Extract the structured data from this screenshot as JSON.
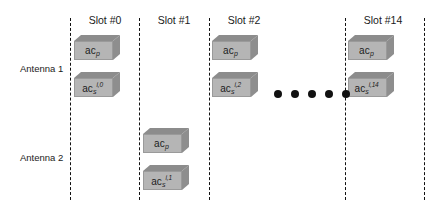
{
  "figure": {
    "background_color": "#ffffff",
    "line_color": "#111111",
    "box_face_color": "#b5b5b5",
    "box_shade_color": "#8c8c8c"
  },
  "rows": [
    {
      "label": "Antenna 1",
      "y": 68
    },
    {
      "label": "Antenna 2",
      "y": 157
    }
  ],
  "slots": [
    {
      "header": "Slot #0",
      "divider_x": 70,
      "header_x": 105
    },
    {
      "header": "Slot #1",
      "divider_x": 139,
      "header_x": 174
    },
    {
      "header": "Slot #2",
      "divider_x": 209,
      "header_x": 244
    },
    {
      "header": "Slot #14",
      "divider_x": 345,
      "header_x": 383
    },
    {
      "header": "",
      "divider_x": 424,
      "header_x": 0
    }
  ],
  "packets": [
    {
      "name": "a1-slot0-pilot",
      "primary": "ac",
      "sub": "p",
      "sup": "",
      "x": 74,
      "y": 35
    },
    {
      "name": "a1-slot0-signal",
      "primary": "ac",
      "sub": "s",
      "sup": "i,0",
      "x": 74,
      "y": 72
    },
    {
      "name": "a1-slot2-pilot",
      "primary": "ac",
      "sub": "p",
      "sup": "",
      "x": 212,
      "y": 35
    },
    {
      "name": "a1-slot2-signal",
      "primary": "ac",
      "sub": "s",
      "sup": "i,2",
      "x": 212,
      "y": 72
    },
    {
      "name": "a1-slot14-pilot",
      "primary": "ac",
      "sub": "p",
      "sup": "",
      "x": 348,
      "y": 35
    },
    {
      "name": "a1-slot14-signal",
      "primary": "ac",
      "sub": "s",
      "sup": "i,14",
      "x": 348,
      "y": 72
    },
    {
      "name": "a2-slot1-pilot",
      "primary": "ac",
      "sub": "p",
      "sup": "",
      "x": 143,
      "y": 128
    },
    {
      "name": "a2-slot1-signal",
      "primary": "ac",
      "sub": "s",
      "sup": "i,1",
      "x": 143,
      "y": 165
    }
  ],
  "ellipsis": {
    "count": 5,
    "y": 90,
    "start_x": 274,
    "spacing": 17
  }
}
